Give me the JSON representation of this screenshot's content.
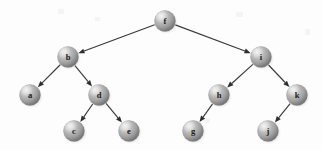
{
  "figure": {
    "kind": "binary-search-tree",
    "background_color": "#fdfdfd",
    "width": 322,
    "height": 150,
    "node_radius": 10.5,
    "node_colors": {
      "highlight": "#e2e2e2",
      "mid": "#ababab",
      "shadow": "#6f6f6f",
      "rim": "#8d8d8d",
      "label": "#1b1b1b"
    },
    "edge_color": "#3a3a3a",
    "arrow_color": "#2e2e2e"
  },
  "nodes": [
    {
      "id": "f",
      "label": "f",
      "x": 165,
      "y": 21,
      "level": 0
    },
    {
      "id": "b",
      "label": "b",
      "x": 68,
      "y": 57,
      "level": 1
    },
    {
      "id": "i",
      "label": "i",
      "x": 261,
      "y": 57,
      "level": 1
    },
    {
      "id": "a",
      "label": "a",
      "x": 30,
      "y": 95,
      "level": 2
    },
    {
      "id": "d",
      "label": "d",
      "x": 99,
      "y": 95,
      "level": 2
    },
    {
      "id": "h",
      "label": "h",
      "x": 219,
      "y": 95,
      "level": 2
    },
    {
      "id": "k",
      "label": "k",
      "x": 297,
      "y": 95,
      "level": 2
    },
    {
      "id": "c",
      "label": "c",
      "x": 74,
      "y": 131,
      "level": 3
    },
    {
      "id": "e",
      "label": "e",
      "x": 129,
      "y": 131,
      "level": 3
    },
    {
      "id": "g",
      "label": "g",
      "x": 193,
      "y": 131,
      "level": 3
    },
    {
      "id": "j",
      "label": "j",
      "x": 268,
      "y": 131,
      "level": 3
    }
  ],
  "edges": [
    {
      "from": "f",
      "to": "b",
      "side": "left"
    },
    {
      "from": "f",
      "to": "i",
      "side": "right"
    },
    {
      "from": "b",
      "to": "a",
      "side": "left"
    },
    {
      "from": "b",
      "to": "d",
      "side": "right"
    },
    {
      "from": "d",
      "to": "c",
      "side": "left"
    },
    {
      "from": "d",
      "to": "e",
      "side": "right"
    },
    {
      "from": "i",
      "to": "h",
      "side": "left"
    },
    {
      "from": "i",
      "to": "k",
      "side": "right"
    },
    {
      "from": "h",
      "to": "g",
      "side": "left"
    },
    {
      "from": "k",
      "to": "j",
      "side": "left"
    }
  ]
}
